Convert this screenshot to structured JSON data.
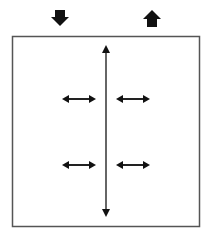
{
  "diagram": {
    "indicators": [
      {
        "name": "down-arrow-icon",
        "direction": "down",
        "x": 60,
        "y": 18
      },
      {
        "name": "up-arrow-icon",
        "direction": "up",
        "x": 152,
        "y": 18
      }
    ],
    "box": {
      "x": 12,
      "y": 36,
      "width": 188,
      "height": 191,
      "stroke": "#555555"
    },
    "vertical_arrow": {
      "x": 106,
      "y1": 46,
      "y2": 216,
      "color": "#333333"
    },
    "horizontal_arrows": [
      {
        "x1": 62,
        "x2": 96,
        "y": 99
      },
      {
        "x1": 116,
        "x2": 150,
        "y": 99
      },
      {
        "x1": 62,
        "x2": 96,
        "y": 165
      },
      {
        "x1": 116,
        "x2": 150,
        "y": 165
      }
    ],
    "colors": {
      "arrow": "#111111",
      "line": "#333333",
      "box": "#555555"
    }
  }
}
